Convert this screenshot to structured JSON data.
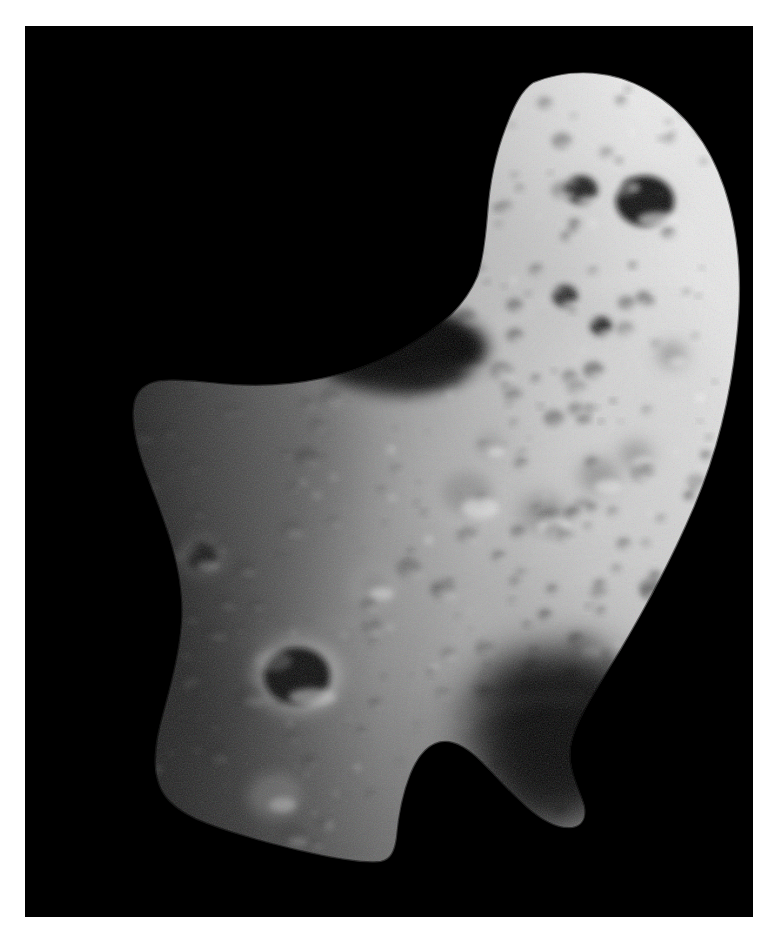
{
  "page": {
    "background_color": "#ffffff",
    "width": 775,
    "height": 941,
    "margin_left": 25,
    "margin_top": 26,
    "margin_right": 22,
    "margin_bottom": 24
  },
  "image": {
    "kind": "astronomical-photograph",
    "subject_name": "asteroid-433-eros",
    "subject_description": "Heavily cratered irregular peanut-shaped asteroid photographed against empty space",
    "mission_hint": "near-shoemaker-spacecraft-image",
    "frame": {
      "x": 25,
      "y": 26,
      "width": 728,
      "height": 891,
      "background_color": "#000000"
    },
    "lighting": {
      "direction": "from-upper-right",
      "terminator_edge": "left",
      "limb_highlight_edge": "right",
      "sun_angle_degrees": 215
    },
    "palette": {
      "space_black": "#000000",
      "shadow_black": "#050505",
      "terminator_dark": "#1a1a1a",
      "midtone_dark": "#6e6e6e",
      "midtone": "#9a9a9a",
      "surface_base": "#b4b4b4",
      "surface_light": "#cfcfcf",
      "limb_highlight": "#ebebeb",
      "crater_floor": "#2a2a2a",
      "crater_rim_bright": "#e0e0e0"
    },
    "silhouette": {
      "description": "Two-lobed elongated body; upper-right lobe points to top-right corner, lower-left lobe fills bottom-left; concave saddle notch on upper-left flank and deep shadow wedge on lower-right flank",
      "outline_path": "M 508 56 C 548 40 590 44 624 64 C 662 86 686 120 700 162 C 716 210 718 262 712 314 C 706 372 692 428 670 480 C 648 532 622 580 596 624 C 580 650 566 672 556 692 C 548 708 544 722 546 736 C 548 752 556 766 560 780 C 562 792 558 800 548 802 C 534 804 518 796 502 782 C 486 768 470 750 456 736 C 444 724 432 716 420 716 C 406 716 394 728 386 748 C 378 768 374 790 372 812 C 370 826 366 834 356 836 C 340 838 316 834 288 828 C 252 820 214 810 182 798 C 156 788 140 776 134 760 C 126 740 130 714 138 686 C 146 656 154 626 156 596 C 158 566 152 538 144 512 C 136 486 126 462 118 440 C 110 416 106 396 108 380 C 110 364 120 356 136 354 C 156 352 182 356 208 358 C 238 360 268 358 296 352 C 326 346 352 336 374 324 C 396 312 412 300 426 288 C 438 276 446 264 452 250 C 458 232 460 212 462 188 C 464 158 470 128 480 102 C 488 80 496 64 508 56 Z"
    },
    "craters": [
      {
        "name": "crater-major-dark-west",
        "cx": 272,
        "cy": 650,
        "r": 34,
        "type": "dark-floor",
        "floor": "#0d0d0d",
        "rim": "#dcdcdc"
      },
      {
        "name": "crater-shadow-north-large",
        "cx": 620,
        "cy": 175,
        "r": 30,
        "type": "dark-floor",
        "floor": "#111111",
        "rim": "#d8d8d8"
      },
      {
        "name": "crater-shadow-north-small",
        "cx": 556,
        "cy": 164,
        "r": 17,
        "type": "dark-floor",
        "floor": "#1a1a1a",
        "rim": "#cccccc"
      },
      {
        "name": "crater-notch-saddle",
        "cx": 400,
        "cy": 322,
        "r": 42,
        "type": "shadow-wedge",
        "floor": "#030303",
        "rim": "#a8a8a8"
      },
      {
        "name": "crater-bowl-center-left",
        "cx": 445,
        "cy": 470,
        "r": 30,
        "type": "soft-bowl",
        "floor": "#8d8d8d",
        "rim": "#d2d2d2"
      },
      {
        "name": "crater-bowl-center",
        "cx": 520,
        "cy": 490,
        "r": 27,
        "type": "soft-bowl",
        "floor": "#8f8f8f",
        "rim": "#d0d0d0"
      },
      {
        "name": "crater-bowl-center-right",
        "cx": 576,
        "cy": 452,
        "r": 22,
        "type": "soft-bowl",
        "floor": "#919191",
        "rim": "#cccccc"
      },
      {
        "name": "crater-bowl-mid-east",
        "cx": 612,
        "cy": 430,
        "r": 17,
        "type": "soft-bowl",
        "floor": "#949494",
        "rim": "#c8c8c8"
      },
      {
        "name": "crater-bowl-upper-mid",
        "cx": 466,
        "cy": 420,
        "r": 15,
        "type": "soft-bowl",
        "floor": "#8f8f8f",
        "rim": "#cacaca"
      },
      {
        "name": "crater-bowl-lower-mid",
        "cx": 350,
        "cy": 560,
        "r": 19,
        "type": "soft-bowl",
        "floor": "#8b8b8b",
        "rim": "#cbcbcb"
      },
      {
        "name": "crater-bowl-southwest",
        "cx": 250,
        "cy": 770,
        "r": 22,
        "type": "soft-bowl",
        "floor": "#848484",
        "rim": "#c0c0c0"
      },
      {
        "name": "crater-bowl-west-rim",
        "cx": 176,
        "cy": 530,
        "r": 16,
        "type": "dark-floor",
        "floor": "#2a2a2a",
        "rim": "#b4b4b4"
      },
      {
        "name": "crater-bowl-north-ridge",
        "cx": 540,
        "cy": 270,
        "r": 13,
        "type": "dark-floor",
        "floor": "#242424",
        "rim": "#c4c4c4"
      },
      {
        "name": "crater-bowl-north-ridge-2",
        "cx": 576,
        "cy": 300,
        "r": 11,
        "type": "dark-floor",
        "floor": "#272727",
        "rim": "#c0c0c0"
      },
      {
        "name": "crater-bowl-east-flank",
        "cx": 648,
        "cy": 330,
        "r": 14,
        "type": "soft-bowl",
        "floor": "#8a8a8a",
        "rim": "#c6c6c6"
      },
      {
        "name": "crater-bowl-lower-east",
        "cx": 560,
        "cy": 620,
        "r": 18,
        "type": "soft-bowl",
        "floor": "#878787",
        "rim": "#c2c2c2"
      }
    ],
    "shadow_regions": [
      {
        "name": "shadow-saddle-notch",
        "description": "Black concave notch between the two lobes on the upper-left flank"
      },
      {
        "name": "shadow-lower-right-wedge",
        "description": "Broad dark wedge separating lower-left lobe from the small lower-right lobe"
      },
      {
        "name": "shadow-terminator-west",
        "description": "Gradual fade into darkness along the entire left limb"
      }
    ],
    "texture": {
      "small_crater_count": 420,
      "boulder_count": 90,
      "grain_opacity": 0.22
    }
  }
}
